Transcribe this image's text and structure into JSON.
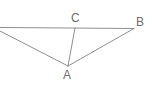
{
  "figure": {
    "type": "geometry-diagram",
    "background_color": "#ffffff",
    "line_color": "#8f8f8f",
    "label_color": "#6e6e6e",
    "width": 152,
    "height": 98,
    "points": [
      {
        "name": "A",
        "label": "A",
        "x": 68,
        "y": 66,
        "label_x": 63,
        "label_y": 69
      },
      {
        "name": "B",
        "label": "B",
        "x": 134,
        "y": 28,
        "label_x": 136,
        "label_y": 16
      },
      {
        "name": "C",
        "label": "C",
        "x": 75,
        "y": 28,
        "label_x": 71,
        "label_y": 12
      }
    ],
    "segments": [
      {
        "name": "horizontal-line-through-C-to-B",
        "x1": 0,
        "y1": 27,
        "x2": 134,
        "y2": 28
      },
      {
        "name": "diagonal-left-edge-to-A",
        "x1": 0,
        "y1": 31,
        "x2": 68,
        "y2": 66
      },
      {
        "name": "segment-C-to-A",
        "x1": 75,
        "y1": 28,
        "x2": 68,
        "y2": 66
      },
      {
        "name": "segment-A-to-B",
        "x1": 68,
        "y1": 66,
        "x2": 134,
        "y2": 28
      }
    ]
  }
}
